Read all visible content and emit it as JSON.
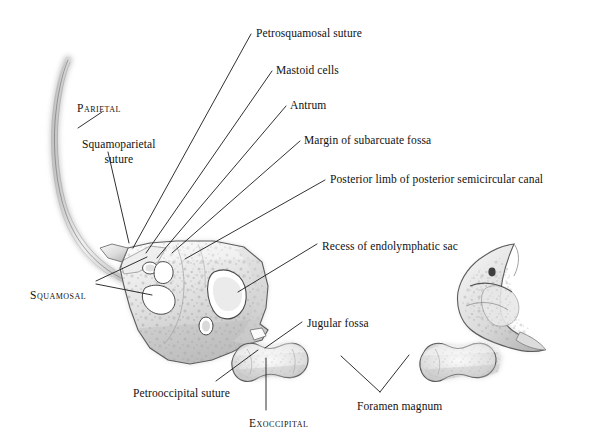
{
  "figure": {
    "background_color": "#ffffff",
    "ink_color": "#111111",
    "bone_tone_light": "#f2f2f2",
    "bone_tone_mid": "#c9c9c9",
    "bone_tone_dark": "#8a8a8a",
    "leader_color": "#1a1a1a"
  },
  "labels": [
    {
      "id": "parietal",
      "text": "Parietal",
      "style": "smallcaps",
      "x": 77,
      "y": 101
    },
    {
      "id": "squamoparietal",
      "text": "Squamoparietal\nsuture",
      "style": "two-line",
      "x": 82,
      "y": 137
    },
    {
      "id": "squamosal",
      "text": "Squamosal",
      "style": "smallcaps",
      "x": 30,
      "y": 288
    },
    {
      "id": "petrosquamosal",
      "text": "Petrosquamosal suture",
      "style": "normal",
      "x": 256,
      "y": 26
    },
    {
      "id": "mastoid-cells",
      "text": "Mastoid cells",
      "style": "normal",
      "x": 276,
      "y": 63
    },
    {
      "id": "antrum",
      "text": "Antrum",
      "style": "normal",
      "x": 290,
      "y": 98
    },
    {
      "id": "subarcuate",
      "text": "Margin of subarcuate fossa",
      "style": "normal",
      "x": 304,
      "y": 133
    },
    {
      "id": "posterior-limb",
      "text": "Posterior limb of posterior semicircular canal",
      "style": "normal",
      "x": 330,
      "y": 172
    },
    {
      "id": "endolymphatic",
      "text": "Recess of endolymphatic sac",
      "style": "normal",
      "x": 322,
      "y": 239
    },
    {
      "id": "jugular-fossa",
      "text": "Jugular fossa",
      "style": "normal",
      "x": 307,
      "y": 316
    },
    {
      "id": "petrooccipital",
      "text": "Petrooccipital suture",
      "style": "normal",
      "x": 133,
      "y": 386
    },
    {
      "id": "exoccipital",
      "text": "Exoccipital",
      "style": "smallcaps",
      "x": 249,
      "y": 416
    },
    {
      "id": "foramen-magnum",
      "text": "Foramen magnum",
      "style": "normal",
      "x": 357,
      "y": 399
    }
  ],
  "leaders": [
    {
      "id": "leader-parietal",
      "points": "102,112 78,128"
    },
    {
      "id": "leader-squamoparietal",
      "points": "108,152 129,243"
    },
    {
      "id": "leader-squamosal-a",
      "points": "96,281 147,257"
    },
    {
      "id": "leader-squamosal-b",
      "points": "96,284 152,295"
    },
    {
      "id": "leader-petrosquamosal",
      "points": "251,34 133,248"
    },
    {
      "id": "leader-mastoid",
      "points": "272,71 146,253"
    },
    {
      "id": "leader-antrum",
      "points": "286,106 157,258"
    },
    {
      "id": "leader-subarcuate",
      "points": "300,141 172,253"
    },
    {
      "id": "leader-posterior-limb",
      "points": "325,180 185,259"
    },
    {
      "id": "leader-endolymphatic",
      "points": "317,244 238,292"
    },
    {
      "id": "leader-jugular",
      "points": "302,322 265,348"
    },
    {
      "id": "leader-petrooccipital",
      "points": "216,381 258,350"
    },
    {
      "id": "leader-exoccipital",
      "points": "266,410 266,358"
    },
    {
      "id": "leader-foramen-a",
      "points": "341,356 380,392"
    },
    {
      "id": "leader-foramen-b",
      "points": "380,392 409,355"
    }
  ],
  "specimens": [
    {
      "id": "parietal-strip",
      "name": "parietal-bone-strip"
    },
    {
      "id": "temporal-bone-main",
      "name": "temporal-bone-left-lateral"
    },
    {
      "id": "exoccipital-left",
      "name": "exoccipital-bone-left"
    },
    {
      "id": "temporal-bone-right",
      "name": "temporal-bone-right-view"
    },
    {
      "id": "exoccipital-right",
      "name": "exoccipital-bone-right"
    }
  ]
}
